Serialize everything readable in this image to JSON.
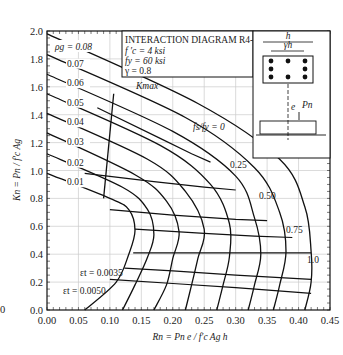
{
  "chart_data": {
    "type": "line",
    "title": "INTERACTION DIAGRAM R4-60.8",
    "parameters": [
      "f'c = 4 ksi",
      "fy = 60 ksi",
      "γ = 0.8"
    ],
    "xlabel": "Rn = Pn e / f'c Ag h",
    "ylabel": "Kn = Pn / f'c Ag",
    "xlim": [
      0.0,
      0.45
    ],
    "ylim": [
      0.0,
      2.0
    ],
    "xticks": [
      "0.00",
      "0.05",
      "0.10",
      "0.15",
      "0.20",
      "0.25",
      "0.30",
      "0.35",
      "0.40",
      "0.45"
    ],
    "yticks": [
      "0.0",
      "0.2",
      "0.4",
      "0.6",
      "0.8",
      "1.0",
      "1.2",
      "1.4",
      "1.6",
      "1.8",
      "2.0"
    ],
    "grid": true,
    "series": [
      {
        "name": "ρg = 0.01",
        "label": "0.01",
        "points": [
          [
            0,
            0.98
          ],
          [
            0.1,
            0.8
          ],
          [
            0.13,
            0.72
          ],
          [
            0.14,
            0.57
          ],
          [
            0.13,
            0.4
          ],
          [
            0.11,
            0.2
          ],
          [
            0.06,
            0.0
          ]
        ]
      },
      {
        "name": "ρg = 0.02",
        "label": "0.02",
        "points": [
          [
            0,
            1.12
          ],
          [
            0.12,
            0.88
          ],
          [
            0.16,
            0.72
          ],
          [
            0.17,
            0.54
          ],
          [
            0.16,
            0.38
          ],
          [
            0.14,
            0.18
          ],
          [
            0.12,
            0.0
          ]
        ]
      },
      {
        "name": "ρg = 0.03",
        "label": "0.03",
        "points": [
          [
            0,
            1.27
          ],
          [
            0.14,
            0.97
          ],
          [
            0.19,
            0.78
          ],
          [
            0.21,
            0.56
          ],
          [
            0.2,
            0.37
          ],
          [
            0.19,
            0.18
          ],
          [
            0.17,
            0.0
          ]
        ]
      },
      {
        "name": "ρg = 0.04",
        "label": "0.04",
        "points": [
          [
            0,
            1.41
          ],
          [
            0.16,
            1.08
          ],
          [
            0.22,
            0.85
          ],
          [
            0.25,
            0.58
          ],
          [
            0.24,
            0.37
          ],
          [
            0.23,
            0.18
          ],
          [
            0.22,
            0.0
          ]
        ]
      },
      {
        "name": "ρg = 0.05",
        "label": "0.05",
        "points": [
          [
            0,
            1.55
          ],
          [
            0.18,
            1.18
          ],
          [
            0.26,
            0.9
          ],
          [
            0.29,
            0.62
          ],
          [
            0.29,
            0.38
          ],
          [
            0.28,
            0.18
          ],
          [
            0.27,
            0.0
          ]
        ]
      },
      {
        "name": "ρg = 0.06",
        "label": "0.06",
        "points": [
          [
            0,
            1.69
          ],
          [
            0.2,
            1.28
          ],
          [
            0.3,
            0.96
          ],
          [
            0.33,
            0.66
          ],
          [
            0.34,
            0.4
          ],
          [
            0.33,
            0.18
          ],
          [
            0.32,
            0.0
          ]
        ]
      },
      {
        "name": "ρg = 0.07",
        "label": "0.07",
        "points": [
          [
            0,
            1.83
          ],
          [
            0.22,
            1.38
          ],
          [
            0.33,
            1.02
          ],
          [
            0.37,
            0.7
          ],
          [
            0.38,
            0.42
          ],
          [
            0.37,
            0.18
          ],
          [
            0.36,
            0.0
          ]
        ]
      },
      {
        "name": "ρg = 0.08",
        "label": "0.08",
        "points": [
          [
            0,
            1.98
          ],
          [
            0.24,
            1.48
          ],
          [
            0.37,
            1.08
          ],
          [
            0.41,
            0.74
          ],
          [
            0.42,
            0.42
          ],
          [
            0.42,
            0.2
          ],
          [
            0.41,
            0.0
          ]
        ]
      }
    ],
    "strain_lines": [
      {
        "name": "fs/fy = 0",
        "points": [
          [
            0.08,
            1.45
          ],
          [
            0.18,
            1.23
          ],
          [
            0.23,
            1.12
          ],
          [
            0.26,
            1.06
          ]
        ]
      },
      {
        "name": "fs/fy = 0.25",
        "points": [
          [
            0.06,
            0.98
          ],
          [
            0.17,
            0.92
          ],
          [
            0.25,
            0.88
          ],
          [
            0.3,
            0.86
          ]
        ]
      },
      {
        "name": "fs/fy = 0.50",
        "points": [
          [
            0.1,
            0.72
          ],
          [
            0.2,
            0.68
          ],
          [
            0.3,
            0.65
          ],
          [
            0.35,
            0.64
          ]
        ]
      },
      {
        "name": "fs/fy = 0.75",
        "points": [
          [
            0.14,
            0.58
          ],
          [
            0.25,
            0.55
          ],
          [
            0.33,
            0.53
          ],
          [
            0.39,
            0.52
          ]
        ]
      },
      {
        "name": "fs/fy = 1.0",
        "points": [
          [
            0.137,
            0.41
          ],
          [
            0.2,
            0.41
          ],
          [
            0.3,
            0.41
          ],
          [
            0.42,
            0.41
          ]
        ]
      },
      {
        "name": "εt = 0.0035",
        "points": [
          [
            0.123,
            0.3
          ],
          [
            0.2,
            0.28
          ],
          [
            0.3,
            0.25
          ],
          [
            0.42,
            0.22
          ]
        ]
      },
      {
        "name": "εt = 0.0050",
        "points": [
          [
            0.1,
            0.22
          ],
          [
            0.2,
            0.19
          ],
          [
            0.3,
            0.16
          ],
          [
            0.42,
            0.12
          ]
        ]
      }
    ],
    "kmax_line": {
      "name": "Kmax",
      "points": [
        [
          0.106,
          1.55
        ],
        [
          0.09,
          0.8
        ]
      ]
    },
    "annotations": [
      "ρg = 0.08",
      "0.07",
      "0.06",
      "0.05",
      "0.04",
      "0.03",
      "0.02",
      "0.01",
      "Kmax",
      "fs/fy = 0",
      "0.25",
      "0.50",
      "0.75",
      "1.0",
      "εt = 0.0035",
      "εt = 0.0050"
    ]
  },
  "labels": {
    "title": "INTERACTION DIAGRAM R4-60.8",
    "fc": "f ′c = 4 ksi",
    "fy": "fy = 60 ksi",
    "gamma": "γ = 0.8",
    "xaxis": "Rn = Pn e / f′c Ag h",
    "yaxis": "Kn = Pn / f′c Ag",
    "rho": "ρg = 0.08",
    "kmax": "Kmax",
    "fs0": "fs/fy = 0",
    "fs25": "0.25",
    "fs50": "0.50",
    "fs75": "0.75",
    "fs100": "1.0",
    "e35": "εt = 0.0035",
    "e50": "εt = 0.0050",
    "inset_h": "h",
    "inset_gh": "γh",
    "inset_e": "e",
    "inset_pn": "Pn",
    "partial_left": "0"
  }
}
